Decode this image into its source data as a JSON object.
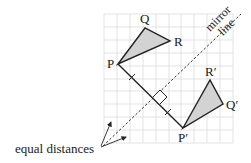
{
  "diagram": {
    "grid": {
      "x": 104,
      "y": 14,
      "cols": 10,
      "rows": 10,
      "cell": 12.9,
      "color": "#dcdcdc"
    },
    "colors": {
      "fill": "#d3d3d3",
      "stroke": "#222222",
      "grid": "#dcdcdc"
    },
    "original_triangle": {
      "points": {
        "P": [
          118,
          64
        ],
        "Q": [
          145,
          28
        ],
        "R": [
          170,
          41
        ]
      },
      "labels": {
        "P": "P",
        "Q": "Q",
        "R": "R"
      }
    },
    "image_triangle": {
      "points": {
        "P": [
          183,
          128
        ],
        "Q": [
          223,
          104
        ],
        "R": [
          210,
          80
        ]
      },
      "labels": {
        "P": "P′",
        "Q": "Q′",
        "R": "R′"
      }
    },
    "mirror_line": {
      "from": [
        103,
        146
      ],
      "to": [
        241,
        14
      ],
      "label_line1": "mirror",
      "label_line2": "line"
    },
    "annotation": {
      "text": "equal distances"
    }
  }
}
